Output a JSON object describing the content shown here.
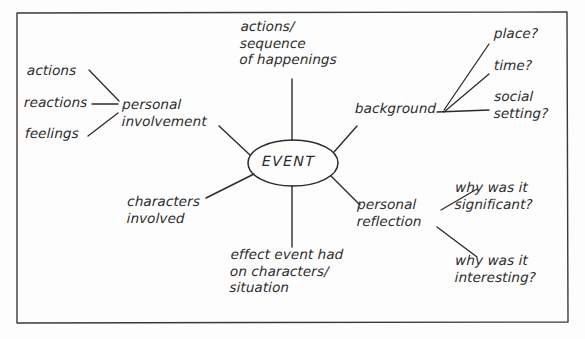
{
  "diagram": {
    "style": "hand-drawn pencil sketch on white paper, rectangular border frame",
    "ink_color": "#2b2b2b",
    "paper_color": "#fdfdfd",
    "center": {
      "label": "EVENT",
      "shape": "ellipse"
    },
    "branches": [
      {
        "id": "personal-involvement",
        "label": "personal\ninvolvement",
        "position": "left",
        "children": [
          {
            "id": "actions",
            "label": "actions"
          },
          {
            "id": "reactions",
            "label": "reactions"
          },
          {
            "id": "feelings",
            "label": "feelings"
          }
        ]
      },
      {
        "id": "actions-sequence",
        "label": "actions/\nsequence\nof happenings",
        "position": "top",
        "children": []
      },
      {
        "id": "background",
        "label": "background",
        "position": "top-right",
        "children": [
          {
            "id": "place",
            "label": "place?"
          },
          {
            "id": "time",
            "label": "time?"
          },
          {
            "id": "social-setting",
            "label": "social\nsetting?"
          }
        ]
      },
      {
        "id": "personal-reflection",
        "label": "personal\nreflection",
        "position": "bottom-right",
        "children": [
          {
            "id": "why-significant",
            "label": "why was it\nsignificant?"
          },
          {
            "id": "why-interesting",
            "label": "why was it\ninteresting?"
          }
        ]
      },
      {
        "id": "effect-event",
        "label": "effect event had\non characters/\nsituation",
        "position": "bottom",
        "children": []
      },
      {
        "id": "characters-involved",
        "label": "characters\ninvolved",
        "position": "bottom-left",
        "children": []
      }
    ]
  }
}
